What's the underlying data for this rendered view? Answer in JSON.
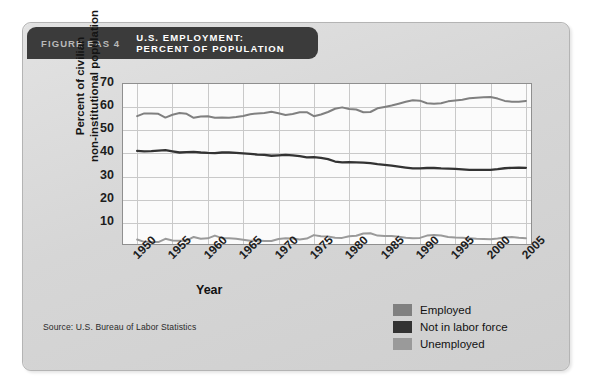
{
  "figure": {
    "number_label": "FIGURE EAS 4",
    "title_line1": "U.S. EMPLOYMENT:",
    "title_line2": "PERCENT OF POPULATION",
    "source": "Source: U.S. Bureau of Labor Statistics"
  },
  "colors": {
    "panel_bg": "#d8d8d8",
    "titlebar_bg": "#3b3b3b",
    "plot_bg": "#fbfbfb",
    "grid": "#c9c9c9",
    "axis": "#8f8f8f",
    "employed": "#808080",
    "not_in_labor_force": "#333333",
    "unemployed": "#9a9a9a"
  },
  "legend": {
    "position": "bottom-right",
    "items": [
      {
        "label": "Employed",
        "color": "#808080"
      },
      {
        "label": "Not in labor force",
        "color": "#333333"
      },
      {
        "label": "Unemployed",
        "color": "#9a9a9a"
      }
    ]
  },
  "chart_data": {
    "type": "line",
    "title": "U.S. EMPLOYMENT: PERCENT OF POPULATION",
    "xlabel": "Year",
    "ylabel": "Percent of civilian non-institutional population",
    "xlim": [
      1948,
      2006
    ],
    "ylim": [
      0,
      70
    ],
    "yticks": [
      10,
      20,
      30,
      40,
      50,
      60,
      70
    ],
    "xticks": [
      1950,
      1955,
      1960,
      1965,
      1970,
      1975,
      1980,
      1985,
      1990,
      1995,
      2000,
      2005
    ],
    "grid": true,
    "x": [
      1950,
      1951,
      1952,
      1953,
      1954,
      1955,
      1956,
      1957,
      1958,
      1959,
      1960,
      1961,
      1962,
      1963,
      1964,
      1965,
      1966,
      1967,
      1968,
      1969,
      1970,
      1971,
      1972,
      1973,
      1974,
      1975,
      1976,
      1977,
      1978,
      1979,
      1980,
      1981,
      1982,
      1983,
      1984,
      1985,
      1986,
      1987,
      1988,
      1989,
      1990,
      1991,
      1992,
      1993,
      1994,
      1995,
      1996,
      1997,
      1998,
      1999,
      2000,
      2001,
      2002,
      2003,
      2004,
      2005
    ],
    "series": [
      {
        "name": "Employed",
        "color": "#808080",
        "values": [
          56.1,
          57.3,
          57.3,
          57.1,
          55.5,
          56.7,
          57.5,
          57.1,
          55.4,
          56.0,
          56.1,
          55.4,
          55.5,
          55.4,
          55.7,
          56.2,
          56.9,
          57.3,
          57.5,
          58.0,
          57.4,
          56.6,
          57.0,
          57.8,
          57.8,
          56.1,
          56.8,
          57.9,
          59.3,
          59.9,
          59.2,
          59.0,
          57.8,
          57.9,
          59.5,
          60.1,
          60.7,
          61.5,
          62.3,
          63.0,
          62.8,
          61.7,
          61.5,
          61.7,
          62.5,
          62.9,
          63.2,
          63.8,
          64.1,
          64.3,
          64.4,
          63.7,
          62.7,
          62.3,
          62.3,
          62.7
        ]
      },
      {
        "name": "Not in labor force",
        "color": "#333333",
        "values": [
          41.1,
          40.9,
          41.0,
          41.2,
          41.4,
          40.9,
          40.4,
          40.6,
          40.7,
          40.4,
          40.2,
          40.1,
          40.4,
          40.4,
          40.2,
          40.0,
          39.8,
          39.5,
          39.4,
          39.0,
          39.2,
          39.4,
          39.2,
          38.8,
          38.3,
          38.4,
          38.1,
          37.5,
          36.5,
          36.1,
          36.2,
          36.1,
          36.0,
          35.8,
          35.4,
          35.1,
          34.7,
          34.3,
          33.9,
          33.5,
          33.5,
          33.7,
          33.7,
          33.5,
          33.4,
          33.3,
          33.1,
          32.9,
          32.9,
          32.9,
          32.9,
          33.2,
          33.6,
          33.8,
          33.9,
          33.8
        ]
      },
      {
        "name": "Unemployed",
        "color": "#9a9a9a",
        "values": [
          2.8,
          1.8,
          1.7,
          1.7,
          3.1,
          2.4,
          2.3,
          2.3,
          3.9,
          3.1,
          3.3,
          4.5,
          3.4,
          3.4,
          3.1,
          2.7,
          2.3,
          2.4,
          2.2,
          2.2,
          3.0,
          3.3,
          3.2,
          2.8,
          3.2,
          4.7,
          4.2,
          4.1,
          3.6,
          3.5,
          4.2,
          4.4,
          5.4,
          5.5,
          4.5,
          4.3,
          4.3,
          4.0,
          3.6,
          3.4,
          3.5,
          4.5,
          4.7,
          4.5,
          3.9,
          3.7,
          3.6,
          3.4,
          3.1,
          3.0,
          2.9,
          3.2,
          3.7,
          3.9,
          3.6,
          3.4
        ]
      }
    ]
  },
  "axis_text": {
    "ylabel_line1": "Percent of civilian",
    "ylabel_line2": "non-institutional population",
    "xlabel": "Year"
  }
}
